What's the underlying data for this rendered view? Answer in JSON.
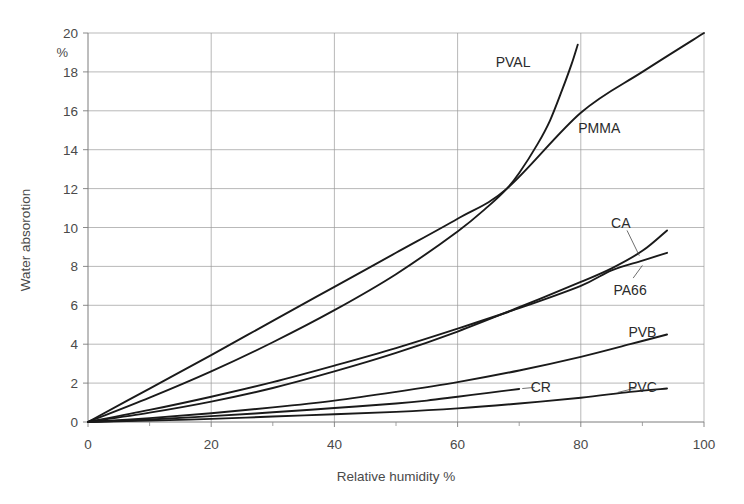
{
  "chart_data": {
    "type": "line",
    "title": "",
    "xlabel": "Relative humidity %",
    "ylabel": "Water absorotion",
    "yunit": "%",
    "xlim": [
      0,
      100
    ],
    "ylim": [
      0,
      20
    ],
    "xticks": [
      0,
      20,
      40,
      60,
      80,
      100
    ],
    "xticklabels": [
      "0",
      "20",
      "40",
      "60",
      "80",
      "100"
    ],
    "yticks": [
      0,
      2,
      4,
      6,
      8,
      10,
      12,
      14,
      16,
      18,
      20
    ],
    "yticklabels": [
      "0",
      "2",
      "4",
      "6",
      "8",
      "10",
      "12",
      "14",
      "16",
      "18",
      "20"
    ],
    "x_minor_interval": 10,
    "grid": "both",
    "legend_position": "inline-labels",
    "series": [
      {
        "name": "PVAL",
        "label": "PVAL",
        "label_x": 69,
        "label_y": 18.5,
        "leader": false,
        "points": [
          [
            0,
            0
          ],
          [
            10,
            1.25
          ],
          [
            20,
            2.6
          ],
          [
            30,
            4.1
          ],
          [
            40,
            5.75
          ],
          [
            50,
            7.6
          ],
          [
            60,
            9.8
          ],
          [
            65,
            11.1
          ],
          [
            68,
            12.0
          ],
          [
            70,
            12.8
          ],
          [
            73,
            14.3
          ],
          [
            75,
            15.5
          ],
          [
            77,
            17.1
          ],
          [
            78.5,
            18.4
          ],
          [
            79.5,
            19.4
          ]
        ]
      },
      {
        "name": "PMMA",
        "label": "PMMA",
        "label_x": 83,
        "label_y": 15.1,
        "leader": false,
        "points": [
          [
            0,
            0
          ],
          [
            10,
            1.72
          ],
          [
            20,
            3.44
          ],
          [
            30,
            5.2
          ],
          [
            40,
            6.95
          ],
          [
            50,
            8.7
          ],
          [
            60,
            10.45
          ],
          [
            68,
            12.0
          ],
          [
            80,
            15.9
          ],
          [
            90,
            18.0
          ],
          [
            100,
            20.0
          ]
        ]
      },
      {
        "name": "CA",
        "label": "CA",
        "label_x": 86.5,
        "label_y": 10.25,
        "leader": true,
        "leader_from": [
          87.5,
          9.85
        ],
        "leader_to": [
          89.5,
          8.55
        ],
        "points": [
          [
            0,
            0
          ],
          [
            10,
            0.48
          ],
          [
            20,
            1.05
          ],
          [
            30,
            1.75
          ],
          [
            40,
            2.6
          ],
          [
            50,
            3.55
          ],
          [
            60,
            4.65
          ],
          [
            70,
            5.9
          ],
          [
            80,
            7.2
          ],
          [
            85,
            7.9
          ],
          [
            90,
            8.8
          ],
          [
            94,
            9.85
          ]
        ]
      },
      {
        "name": "PA66",
        "label": "PA66",
        "label_x": 88,
        "label_y": 6.8,
        "leader": true,
        "leader_from": [
          88.5,
          7.4
        ],
        "leader_to": [
          90,
          8.05
        ],
        "points": [
          [
            0,
            0
          ],
          [
            10,
            0.62
          ],
          [
            20,
            1.3
          ],
          [
            30,
            2.05
          ],
          [
            40,
            2.9
          ],
          [
            50,
            3.8
          ],
          [
            60,
            4.8
          ],
          [
            70,
            5.85
          ],
          [
            80,
            7.0
          ],
          [
            85,
            7.8
          ],
          [
            90,
            8.3
          ],
          [
            94,
            8.7
          ]
        ]
      },
      {
        "name": "PVB",
        "label": "PVB",
        "label_x": 90,
        "label_y": 4.65,
        "leader": false,
        "points": [
          [
            0,
            0
          ],
          [
            10,
            0.2
          ],
          [
            20,
            0.45
          ],
          [
            30,
            0.75
          ],
          [
            40,
            1.1
          ],
          [
            50,
            1.55
          ],
          [
            60,
            2.05
          ],
          [
            70,
            2.65
          ],
          [
            80,
            3.35
          ],
          [
            88,
            4.0
          ],
          [
            94,
            4.5
          ]
        ]
      },
      {
        "name": "CR",
        "label": "CR",
        "label_x": 73.5,
        "label_y": 1.8,
        "leader": true,
        "leader_from": [
          72.5,
          1.78
        ],
        "leader_to": [
          70.5,
          1.72
        ],
        "points": [
          [
            0,
            0
          ],
          [
            10,
            0.13
          ],
          [
            20,
            0.3
          ],
          [
            30,
            0.5
          ],
          [
            40,
            0.72
          ],
          [
            50,
            0.95
          ],
          [
            55,
            1.1
          ],
          [
            60,
            1.3
          ],
          [
            65,
            1.5
          ],
          [
            70,
            1.7
          ]
        ]
      },
      {
        "name": "PVC",
        "label": "PVC",
        "label_x": 90,
        "label_y": 1.78,
        "leader": true,
        "leader_from": [
          89,
          1.75
        ],
        "leader_to": [
          86,
          1.52
        ],
        "points": [
          [
            0,
            0
          ],
          [
            10,
            0.07
          ],
          [
            20,
            0.16
          ],
          [
            30,
            0.28
          ],
          [
            40,
            0.4
          ],
          [
            50,
            0.52
          ],
          [
            60,
            0.7
          ],
          [
            70,
            0.95
          ],
          [
            80,
            1.25
          ],
          [
            88,
            1.55
          ],
          [
            94,
            1.72
          ]
        ]
      }
    ]
  },
  "plot_geometry": {
    "left": 88,
    "right": 704,
    "top": 33,
    "bottom": 422
  }
}
